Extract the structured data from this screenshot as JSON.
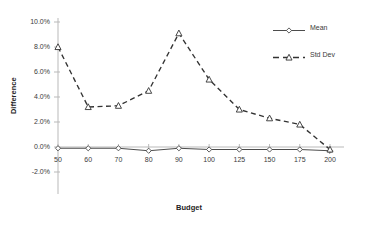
{
  "chart_data": {
    "type": "line",
    "title": "",
    "xlabel": "Budget",
    "ylabel": "Difference",
    "categories": [
      "50",
      "60",
      "70",
      "80",
      "90",
      "100",
      "125",
      "150",
      "175",
      "200"
    ],
    "ylim": [
      -0.02,
      0.1
    ],
    "ytick_labels": [
      "10.0%",
      "8.0%",
      "6.0%",
      "4.0%",
      "2.0%",
      "0.0%",
      "-2.0%"
    ],
    "ytick_values": [
      0.1,
      0.08,
      0.06,
      0.04,
      0.02,
      0.0,
      -0.02
    ],
    "grid": false,
    "legend_position": "right",
    "series": [
      {
        "name": "Mean",
        "marker": "diamond",
        "line_style": "solid",
        "color": "#4d4d4d",
        "values": [
          -0.001,
          -0.001,
          -0.001,
          -0.003,
          -0.001,
          -0.002,
          -0.002,
          -0.002,
          -0.002,
          -0.003
        ]
      },
      {
        "name": "Std Dev",
        "marker": "triangle",
        "line_style": "dashed",
        "color": "#333333",
        "values": [
          0.08,
          0.032,
          0.033,
          0.045,
          0.091,
          0.054,
          0.03,
          0.023,
          0.018,
          -0.002
        ]
      }
    ]
  },
  "axis": {
    "y_title": "Difference",
    "x_title": "Budget"
  },
  "legend": {
    "items": [
      {
        "label": "Mean"
      },
      {
        "label": "Std Dev"
      }
    ]
  }
}
